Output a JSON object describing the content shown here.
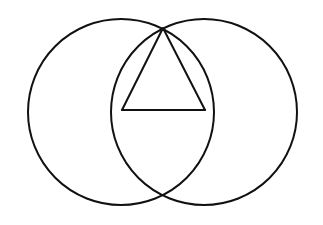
{
  "canvas": {
    "width": 323,
    "height": 225,
    "background_color": "#ffffff",
    "title": "Two overlapping circles with inscribed triangle"
  },
  "style": {
    "stroke_color": "#111111",
    "stroke_width": 2,
    "fill": "none"
  },
  "chart_data": {
    "type": "diagram",
    "xlabel": "",
    "ylabel": "",
    "xlim": [
      0,
      323
    ],
    "ylim": [
      0,
      225
    ],
    "grid": false,
    "legend": "none",
    "shapes": [
      {
        "name": "left-circle",
        "type": "circle",
        "cx": 121,
        "cy": 112,
        "r": 93,
        "stroke": "#111111",
        "stroke_width": 2,
        "fill": "none"
      },
      {
        "name": "right-circle",
        "type": "circle",
        "cx": 204,
        "cy": 112,
        "r": 93,
        "stroke": "#111111",
        "stroke_width": 2,
        "fill": "none"
      },
      {
        "name": "triangle",
        "type": "polygon",
        "points": "163,28 205,110 122,110",
        "stroke": "#111111",
        "stroke_width": 2,
        "fill": "none"
      },
      {
        "name": "triangle-base-line",
        "type": "line",
        "x1": 122,
        "y1": 110,
        "x2": 205,
        "y2": 110,
        "stroke": "#111111",
        "stroke_width": 2
      }
    ],
    "points": [
      {
        "name": "top-intersection",
        "x": 163,
        "y": 28
      },
      {
        "name": "bottom-intersection",
        "x": 163,
        "y": 196
      },
      {
        "name": "triangle-base-left",
        "x": 122,
        "y": 110
      },
      {
        "name": "triangle-base-right",
        "x": 205,
        "y": 110
      },
      {
        "name": "left-circle-center",
        "x": 121,
        "y": 112
      },
      {
        "name": "right-circle-center",
        "x": 204,
        "y": 112
      }
    ],
    "annotations": []
  }
}
